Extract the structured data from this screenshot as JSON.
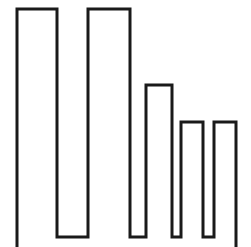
{
  "figure": {
    "alt_text": "Bar chart icon drawn as a single black outline of five descending bars",
    "width": 251,
    "height": 247,
    "background_color": "#ffffff",
    "stroke_color": "#1a1a1a",
    "stroke_width": 3,
    "style": "outline"
  },
  "chart_data": {
    "type": "bar",
    "title": "",
    "xlabel": "",
    "ylabel": "",
    "categories": [
      "1",
      "2",
      "3",
      "4",
      "5"
    ],
    "values": [
      228,
      228,
      152,
      115,
      115
    ],
    "values_normalized": [
      100,
      100,
      67,
      50,
      50
    ],
    "ylim": [
      0,
      228
    ],
    "grid": false,
    "legend": false,
    "axis_visible": false,
    "tick_labels_visible": false,
    "baseline_y": 237,
    "bars": [
      {
        "label": "1",
        "x_left": 17,
        "x_right": 57,
        "y_top": 9,
        "height": 228,
        "width": 40
      },
      {
        "label": "2",
        "x_left": 88,
        "x_right": 130,
        "y_top": 9,
        "height": 228,
        "width": 42
      },
      {
        "label": "3",
        "x_left": 146,
        "x_right": 172,
        "y_top": 85,
        "height": 152,
        "width": 26
      },
      {
        "label": "4",
        "x_left": 181,
        "x_right": 203,
        "y_top": 122,
        "height": 115,
        "width": 22
      },
      {
        "label": "5",
        "x_left": 214,
        "x_right": 236,
        "y_top": 122,
        "height": 115,
        "width": 22
      }
    ],
    "outline_path": "M 17 247 L 17 9 L 57 9 L 57 237 L 88 237 L 88 9 L 130 9 L 130 237 L 146 237 L 146 85 L 172 85 L 172 237 L 181 237 L 181 122 L 203 122 L 203 237 L 214 237 L 214 122 L 236 122 L 236 247"
  }
}
